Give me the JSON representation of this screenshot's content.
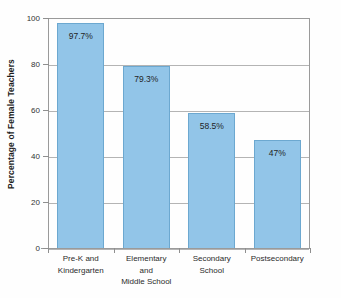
{
  "chart_data": {
    "type": "bar",
    "title": "",
    "xlabel": "",
    "ylabel": "Percentage of Female Teachers",
    "ylim": [
      0,
      100
    ],
    "yticks": [
      0,
      20,
      40,
      60,
      80,
      100
    ],
    "ytick_labels": [
      "0",
      "20",
      "40",
      "60",
      "80",
      "100"
    ],
    "grid": true,
    "legend": "none",
    "bar_color": "#92c5e8",
    "bar_edge_color": "#6ca8d0",
    "categories": [
      "Pre-K and Kindergarten",
      "Elementary and Middle School",
      "Secondary School",
      "Postsecondary"
    ],
    "category_lines": [
      [
        "Pre-K and",
        "Kindergarten"
      ],
      [
        "Elementary",
        "and",
        "Middle School"
      ],
      [
        "Secondary",
        "School"
      ],
      [
        "Postsecondary"
      ]
    ],
    "values": [
      97.7,
      79.3,
      58.5,
      47
    ],
    "value_labels": [
      "97.7%",
      "79.3%",
      "58.5%",
      "47%"
    ]
  }
}
